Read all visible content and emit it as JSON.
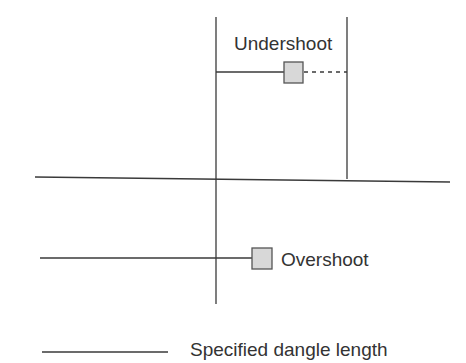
{
  "diagram": {
    "labels": {
      "undershoot": "Undershoot",
      "overshoot": "Overshoot"
    },
    "legend": {
      "label": "Specified dangle length"
    },
    "colors": {
      "line": "#3a3a3a",
      "box_fill": "#d8d8d8",
      "box_stroke": "#555555",
      "text": "#333333"
    }
  }
}
